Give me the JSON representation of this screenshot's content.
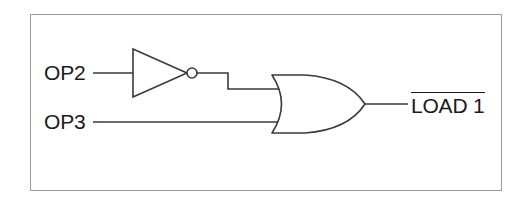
{
  "diagram": {
    "background_color": "#ffffff",
    "frame_color": "#9a9a9a",
    "line_color": "#3a3a3a",
    "text_color": "#1a1a1a"
  },
  "inputs": [
    {
      "id": "op2",
      "label": "OP2",
      "wire_y": 73
    },
    {
      "id": "op3",
      "label": "OP3",
      "wire_y": 122
    }
  ],
  "gates": [
    {
      "id": "inverter",
      "type": "NOT",
      "symbol": "triangle-with-bubble",
      "inputs": [
        "OP2"
      ],
      "has_output_bubble": true
    },
    {
      "id": "or-gate",
      "type": "OR",
      "symbol": "curved-back-or",
      "inputs": [
        "NOT OP2",
        "OP3"
      ],
      "has_output_bubble": false
    }
  ],
  "output": {
    "id": "load1",
    "label": "LOAD 1",
    "active_low": true,
    "overbar": true
  },
  "connections": [
    {
      "from": "OP2",
      "to": "inverter-input"
    },
    {
      "from": "inverter-output",
      "to": "or-gate-input-1",
      "routing": "step-down"
    },
    {
      "from": "OP3",
      "to": "or-gate-input-2",
      "routing": "straight"
    },
    {
      "from": "or-gate-output",
      "to": "LOAD 1"
    }
  ]
}
